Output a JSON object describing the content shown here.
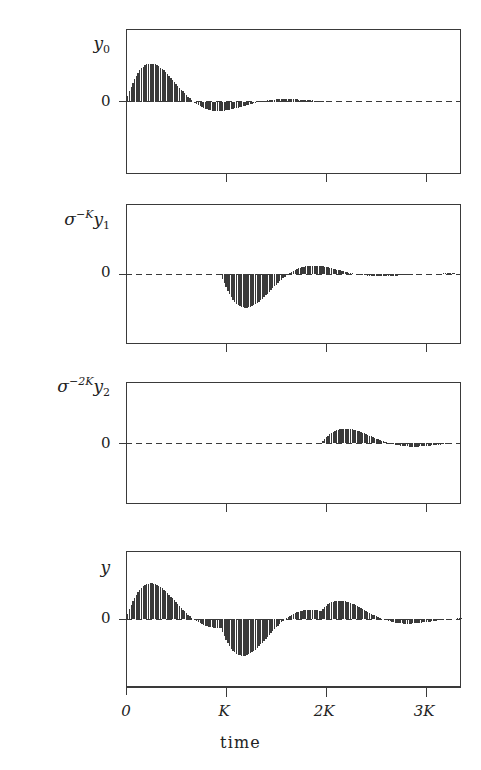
{
  "figure": {
    "axis_title": "time",
    "zero_label": "0",
    "line_color": "#3a3a3a",
    "bar_color": "#3a3a3a",
    "background": "#ffffff"
  },
  "xaxis": {
    "ticks": [
      {
        "label": "0",
        "value": 0
      },
      {
        "label": "K",
        "value": 1
      },
      {
        "label": "2K",
        "value": 2
      },
      {
        "label": "3K",
        "value": 3
      }
    ],
    "range": [
      0,
      3.35
    ],
    "title": "time"
  },
  "panels": [
    {
      "name": "panel-y0",
      "label_main": "y",
      "label_sub": "0",
      "label_pre": "",
      "label_pre_sup": "",
      "zero_label": "0",
      "series_name": "y0"
    },
    {
      "name": "panel-y1",
      "label_main": "y",
      "label_sub": "1",
      "label_pre": "σ",
      "label_pre_sup": "−K",
      "zero_label": "0",
      "series_name": "sigma^-K y1"
    },
    {
      "name": "panel-y2",
      "label_main": "y",
      "label_sub": "2",
      "label_pre": "σ",
      "label_pre_sup": "−2K",
      "zero_label": "0",
      "series_name": "sigma^-2K y2"
    },
    {
      "name": "panel-y",
      "label_main": "y",
      "label_sub": "",
      "label_pre": "",
      "label_pre_sup": "",
      "zero_label": "0",
      "series_name": "y"
    }
  ],
  "chart_data": {
    "type": "line",
    "title": "",
    "xlabel": "time",
    "ylabel": "",
    "xlim": [
      0,
      3.35
    ],
    "grid": false,
    "legend": "none",
    "model": {
      "waveform": "A * exp(-decay * t) * sin(2*pi*t/period) for t >= delay, else 0",
      "period": 1.35,
      "decay": 2.05,
      "amplitude": 1.0,
      "samples_per_unit": 58
    },
    "series": [
      {
        "name": "y0",
        "panel": 0,
        "delay": 0.0,
        "amplitude": 1.0,
        "ylim": [
          -1.05,
          1.05
        ],
        "peak_positive": {
          "t": 0.24,
          "value": 0.72
        },
        "peak_negative": {
          "t": 0.92,
          "value": -0.52
        },
        "zero_crossings": [
          0.0,
          0.675,
          1.35,
          2.025
        ]
      },
      {
        "name": "sigma^-K y1",
        "panel": 1,
        "delay": 0.95,
        "amplitude": -0.92,
        "ylim": [
          -1.05,
          1.05
        ],
        "peak_negative": {
          "t": 1.2,
          "value": -0.62
        },
        "peak_positive": {
          "t": 1.88,
          "value": 0.78
        },
        "zero_crossings": [
          0.95,
          1.62,
          2.3,
          2.97
        ]
      },
      {
        "name": "sigma^-2K y2",
        "panel": 2,
        "delay": 1.95,
        "amplitude": 0.45,
        "ylim": [
          -1.05,
          1.05
        ],
        "peak_positive": {
          "t": 2.18,
          "value": 0.21
        },
        "peak_negative": {
          "t": 2.55,
          "value": -0.33
        },
        "zero_crossings": [
          1.95,
          2.35,
          3.0
        ]
      },
      {
        "name": "y",
        "panel": 3,
        "delay": 0.0,
        "amplitude": 1.0,
        "ylim": [
          -1.05,
          1.05
        ],
        "description": "Sum of y0 + sigma^-K y1 + sigma^-2K y2",
        "peak_positive_1": {
          "t": 0.24,
          "value": 0.74
        },
        "peak_negative_1": {
          "t": 1.02,
          "value": -0.7
        },
        "peak_positive_2": {
          "t": 1.9,
          "value": 0.7
        },
        "peak_negative_2": {
          "t": 2.58,
          "value": -0.33
        }
      }
    ]
  }
}
